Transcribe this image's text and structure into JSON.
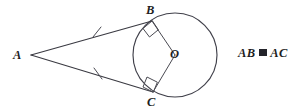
{
  "figure": {
    "background_color": "#ffffff",
    "stroke_color": "#3a3a42",
    "label_color": "#1d1d22"
  },
  "labels": {
    "external_point": "A",
    "tangent_point_upper": "B",
    "tangent_point_lower": "C",
    "center": "O"
  },
  "statement": {
    "left_term": "AB",
    "relation_symbol": "≅",
    "relation_name": "congruent-to",
    "right_term": "AC",
    "full_text": "AB ≅ AC"
  },
  "geometry": {
    "circle": {
      "cx": 175,
      "cy": 55,
      "r": 42
    },
    "points": {
      "A": {
        "x": 31,
        "y": 55
      },
      "B": {
        "x": 152,
        "y": 21
      },
      "C": {
        "x": 153,
        "y": 92
      },
      "O": {
        "x": 175,
        "y": 55
      }
    },
    "segments": [
      {
        "name": "AB",
        "from": "A",
        "to": "B",
        "tick_marks": 1
      },
      {
        "name": "AC",
        "from": "A",
        "to": "C",
        "tick_marks": 1
      },
      {
        "name": "OB",
        "from": "O",
        "to": "B",
        "tick_marks": 0
      },
      {
        "name": "OC",
        "from": "O",
        "to": "C",
        "tick_marks": 0
      }
    ],
    "right_angles": [
      {
        "at": "B",
        "between": [
          "AB",
          "OB"
        ]
      },
      {
        "at": "C",
        "between": [
          "AC",
          "OC"
        ]
      }
    ],
    "tick_positions": [
      {
        "segment": "AB",
        "x": 97,
        "y": 32
      },
      {
        "segment": "AC",
        "x": 98,
        "y": 73
      }
    ]
  }
}
